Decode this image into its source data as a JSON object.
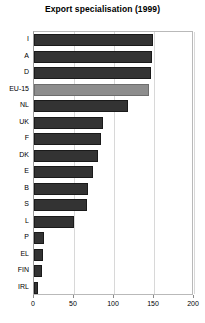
{
  "chart_data": {
    "type": "bar",
    "orientation": "horizontal",
    "title": "Export specialisation (1999)",
    "xlabel": "",
    "ylabel": "",
    "xlim": [
      0,
      200
    ],
    "ylim": null,
    "grid": true,
    "legend": false,
    "legend_position": "none",
    "xticks": [
      0,
      50,
      100,
      150,
      200
    ],
    "xtick_labels": [
      "0",
      "50",
      "100",
      "150",
      "200"
    ],
    "categories": [
      "I",
      "A",
      "D",
      "EU-15",
      "NL",
      "UK",
      "F",
      "DK",
      "E",
      "B",
      "S",
      "L",
      "P",
      "EL",
      "FIN",
      "IRL"
    ],
    "values": [
      149,
      147,
      146,
      144,
      117,
      86,
      84,
      80,
      74,
      68,
      66,
      50,
      13,
      11,
      10,
      5
    ],
    "highlight_category": "EU-15",
    "colors": {
      "bar": "#333333",
      "bar_highlight": "#8d8d8d",
      "grid": "#d8d8d8",
      "axis": "#9a9a9a",
      "background": "#ffffff",
      "text": "#000000"
    }
  }
}
